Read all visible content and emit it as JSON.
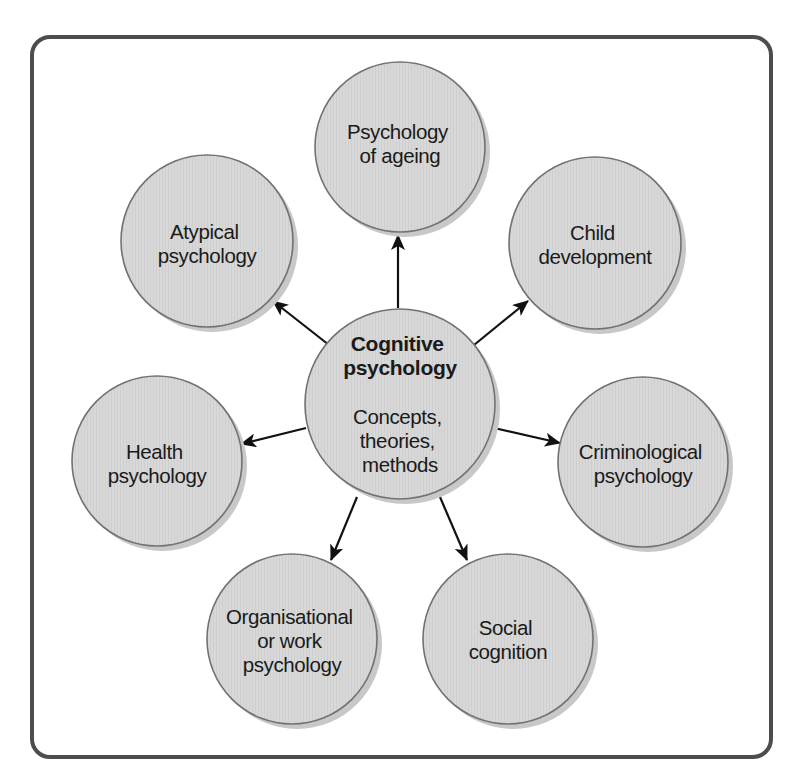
{
  "diagram": {
    "type": "hub-and-spoke",
    "colors": {
      "frame_stroke": "#4d4d4d",
      "circle_fill": "#d6d6d6",
      "circle_stroke": "#727272",
      "circle_shadow": "#c8c8c8",
      "arrow": "#111111",
      "text": "#1a1a1a"
    },
    "center": {
      "title_lines": [
        "Cognitive",
        "psychology"
      ],
      "subtitle_lines": [
        "Concepts,",
        "theories,",
        "methods"
      ]
    },
    "nodes": [
      {
        "id": "ageing",
        "lines": [
          "Psychology",
          "of ageing"
        ]
      },
      {
        "id": "child",
        "lines": [
          "Child",
          "development"
        ]
      },
      {
        "id": "criminological",
        "lines": [
          "Criminological",
          "psychology"
        ]
      },
      {
        "id": "social",
        "lines": [
          "Social",
          "cognition"
        ]
      },
      {
        "id": "organisational",
        "lines": [
          "Organisational",
          "or work",
          "psychology"
        ]
      },
      {
        "id": "health",
        "lines": [
          "Health",
          "psychology"
        ]
      },
      {
        "id": "atypical",
        "lines": [
          "Atypical",
          "psychology"
        ]
      }
    ],
    "edges": [
      {
        "from": "center",
        "to": "ageing"
      },
      {
        "from": "center",
        "to": "child"
      },
      {
        "from": "center",
        "to": "criminological"
      },
      {
        "from": "center",
        "to": "social"
      },
      {
        "from": "center",
        "to": "organisational"
      },
      {
        "from": "center",
        "to": "health"
      },
      {
        "from": "center",
        "to": "atypical"
      }
    ]
  }
}
